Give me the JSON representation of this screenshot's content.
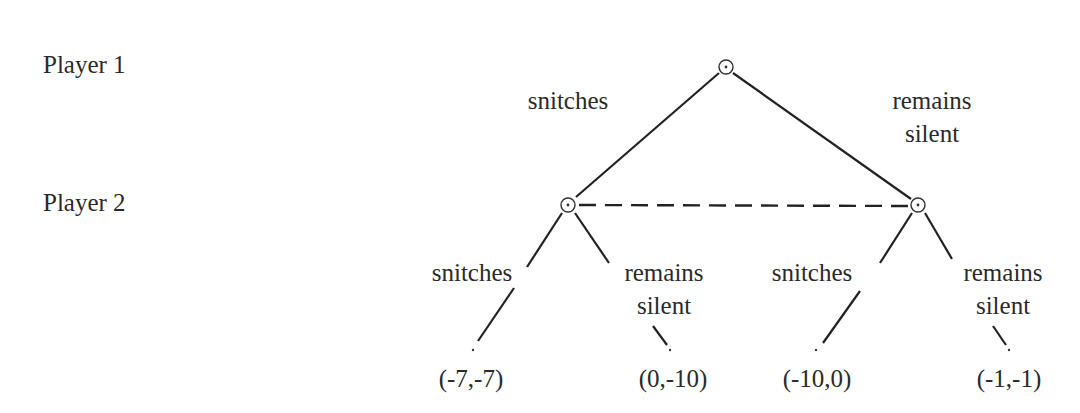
{
  "diagram": {
    "type": "extensive-form game tree",
    "players": [
      {
        "label": "Player 1"
      },
      {
        "label": "Player 2"
      }
    ],
    "root": {
      "player": "Player 1",
      "actions": [
        {
          "label_line1": "snitches",
          "label_line2": ""
        },
        {
          "label_line1": "remains",
          "label_line2": "silent"
        }
      ]
    },
    "information_set": {
      "style": "dashed",
      "description": "Player 2 nodes connected"
    },
    "player2_left": {
      "actions": [
        {
          "label_line1": "snitches",
          "label_line2": ""
        },
        {
          "label_line1": "remains",
          "label_line2": "silent"
        }
      ]
    },
    "player2_right": {
      "actions": [
        {
          "label_line1": "snitches",
          "label_line2": ""
        },
        {
          "label_line1": "remains",
          "label_line2": "silent"
        }
      ]
    },
    "payoffs": [
      {
        "label": "(-7,-7)"
      },
      {
        "label": "(0,-10)"
      },
      {
        "label": "(-10,0)"
      },
      {
        "label": "(-1,-1)"
      }
    ],
    "colors": {
      "line": "#222222",
      "text": "#2a2a2a",
      "background": "#ffffff"
    }
  }
}
